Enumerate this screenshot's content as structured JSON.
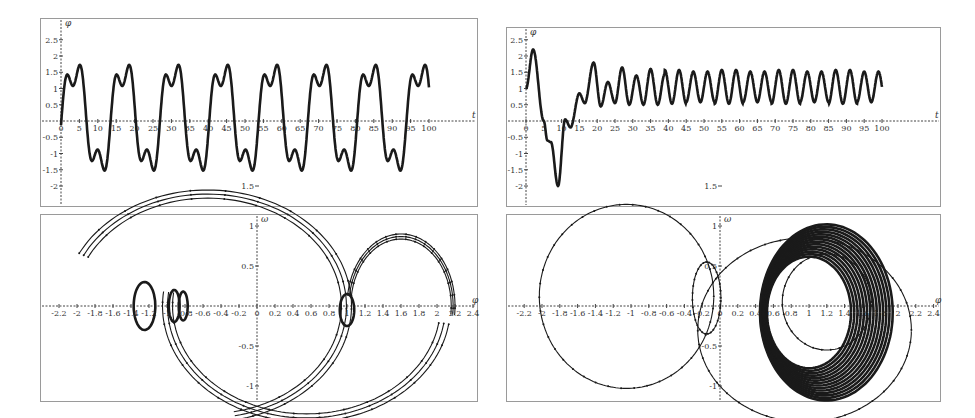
{
  "chart_data": [
    {
      "id": "top-left",
      "type": "line",
      "title": "",
      "xlabel": "t",
      "ylabel": "φ",
      "xlim": [
        -2,
        104
      ],
      "ylim": [
        -2.3,
        2.6
      ],
      "x_ticks": [
        0,
        5,
        10,
        15,
        20,
        25,
        30,
        35,
        40,
        45,
        50,
        55,
        60,
        65,
        70,
        75,
        80,
        85,
        90,
        95,
        100
      ],
      "y_ticks": [
        -2,
        -1.5,
        -1,
        -0.5,
        0.5,
        1,
        1.5,
        2,
        2.5
      ],
      "x_tick_labels": [
        "0",
        "5",
        "10",
        "15",
        "20",
        "25",
        "30",
        "35",
        "40",
        "45",
        "50",
        "55",
        "60",
        "65",
        "70",
        "75",
        "80",
        "85",
        "90",
        "95",
        "100"
      ],
      "y_tick_labels": [
        "-2",
        "-1.5",
        "-1",
        "-0.5",
        "0.5",
        "1",
        "1.5",
        "2",
        "2.5"
      ],
      "grid": false,
      "description": "Periodic oscillation, period ~13.4, peaks ~2.2, troughs ~-2.1, shoulder ~0.9 on rise and ~-1.2 on fall",
      "model": {
        "kind": "periodic",
        "period": 13.4,
        "start": 1.0,
        "end": -0.95
      }
    },
    {
      "id": "top-right",
      "type": "line",
      "title": "",
      "xlabel": "t",
      "ylabel": "φ",
      "xlim": [
        -2,
        104
      ],
      "ylim": [
        -2.3,
        2.6
      ],
      "x_ticks": [
        0,
        5,
        10,
        15,
        20,
        25,
        30,
        35,
        40,
        45,
        50,
        55,
        60,
        65,
        70,
        75,
        80,
        85,
        90,
        95,
        100
      ],
      "y_ticks": [
        -2,
        -1.5,
        -1,
        -0.5,
        0.5,
        1,
        1.5,
        2,
        2.5
      ],
      "x_tick_labels": [
        "0",
        "5",
        "10",
        "15",
        "20",
        "25",
        "30",
        "35",
        "40",
        "45",
        "50",
        "55",
        "60",
        "65",
        "70",
        "75",
        "80",
        "85",
        "90",
        "95",
        "100"
      ],
      "y_tick_labels": [
        "-2",
        "-1.5",
        "-1",
        "-0.5",
        "0.5",
        "1",
        "1.5",
        "2",
        "2.5"
      ],
      "grid": false,
      "description": "Transient (peak 2.2 at t≈2, trough -2.0 at t≈9) then settles to oscillation between ~0.5 and ~1.6, period ~4",
      "key_points": [
        [
          0,
          1.0
        ],
        [
          2,
          2.2
        ],
        [
          5,
          0.0
        ],
        [
          6,
          -0.6
        ],
        [
          7,
          -0.65
        ],
        [
          9,
          -2.0
        ],
        [
          11,
          0.05
        ],
        [
          12.5,
          -0.2
        ],
        [
          15,
          0.85
        ],
        [
          16.5,
          0.55
        ],
        [
          19,
          1.8
        ],
        [
          21,
          0.45
        ],
        [
          23,
          1.2
        ],
        [
          25,
          0.55
        ],
        [
          27,
          1.65
        ],
        [
          29,
          0.5
        ],
        [
          31,
          1.4
        ],
        [
          33,
          0.5
        ],
        [
          35,
          1.6
        ],
        [
          37,
          0.5
        ],
        [
          39,
          1.45
        ],
        [
          100,
          1.5
        ]
      ],
      "steady_state": {
        "min": 0.5,
        "max": 1.6,
        "period": 4.0
      }
    },
    {
      "id": "bottom-left",
      "type": "line",
      "title": "",
      "xlabel": "φ",
      "ylabel": "ω",
      "xlim": [
        -2.35,
        2.45
      ],
      "ylim": [
        -1.75,
        1.75
      ],
      "x_ticks": [
        -2.2,
        -2,
        -1.8,
        -1.6,
        -1.4,
        -1.2,
        -1,
        -0.8,
        -0.6,
        -0.4,
        -0.2,
        0,
        0.2,
        0.4,
        0.6,
        0.8,
        1,
        1.2,
        1.4,
        1.6,
        1.8,
        2,
        2.2,
        2.4
      ],
      "y_ticks": [
        -1.5,
        -1,
        -0.5,
        0.5,
        1,
        1.5
      ],
      "x_tick_labels": [
        "-2.2",
        "-2",
        "-1.8",
        "-1.6",
        "-1.4",
        "-1.2",
        "-1",
        "-0.8",
        "-0.6",
        "-0.4",
        "-0.2",
        "0",
        "0.2",
        "0.4",
        "0.6",
        "0.8",
        "1",
        "1.2",
        "1.4",
        "1.6",
        "1.8",
        "2",
        "2.2",
        "2.4"
      ],
      "y_tick_labels": [
        "-1.5",
        "-1",
        "-0.5",
        "0.5",
        "1",
        "1.5"
      ],
      "grid": false,
      "description": "Phase portrait: large closed orbit spanning φ from -2.2 to 2.2, ω from -1.5 to 1.5, with small loops near φ≈-1.2, -0.9, -0.8 and near φ≈1.0"
    },
    {
      "id": "bottom-right",
      "type": "line",
      "title": "",
      "xlabel": "φ",
      "ylabel": "ω",
      "xlim": [
        -2.35,
        2.45
      ],
      "ylim": [
        -1.75,
        1.75
      ],
      "x_ticks": [
        -2.2,
        -2,
        -1.8,
        -1.6,
        -1.4,
        -1.2,
        -1,
        -0.8,
        -0.6,
        -0.4,
        -0.2,
        0,
        0.2,
        0.4,
        0.6,
        0.8,
        1,
        1.2,
        1.4,
        1.6,
        1.8,
        2,
        2.2,
        2.4
      ],
      "y_ticks": [
        -1.5,
        -1,
        -0.5,
        0.5,
        1,
        1.5
      ],
      "x_tick_labels": [
        "-2.2",
        "-2",
        "-1.8",
        "-1.6",
        "-1.4",
        "-1.2",
        "-1",
        "-0.8",
        "-0.6",
        "-0.4",
        "-0.2",
        "0",
        "0.2",
        "0.4",
        "0.6",
        "0.8",
        "1",
        "1.2",
        "1.4",
        "1.6",
        "1.8",
        "2",
        "2.2",
        "2.4"
      ],
      "y_tick_labels": [
        "-1.5",
        "-1",
        "-0.5",
        "0.5",
        "1",
        "1.5"
      ],
      "grid": false,
      "description": "Phase portrait: transient large loop from φ≈-2.0 to 2.1, small loop near φ≈-0.1, then converging to dense attractor ellipse centred near φ≈1.05, ω≈0, radius ~0.5"
    }
  ],
  "labels": {
    "t": "t",
    "phi": "φ",
    "omega": "ω"
  }
}
